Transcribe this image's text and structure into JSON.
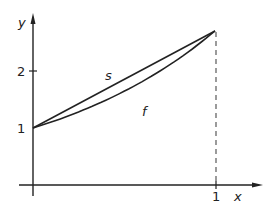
{
  "diagram": {
    "axes": {
      "x_label": "x",
      "y_label": "y",
      "x_ticks": [
        {
          "value": 1,
          "label": "1"
        }
      ],
      "y_ticks": [
        {
          "value": 1,
          "label": "1"
        },
        {
          "value": 2,
          "label": "2"
        }
      ]
    },
    "curves": [
      {
        "name": "f",
        "label": "f",
        "description": "convex curve from (0,1) to (1,e)",
        "function": "e^x"
      },
      {
        "name": "s",
        "label": "s",
        "description": "straight secant line from (0,1) to (1,e)"
      }
    ],
    "guide_line": {
      "style": "dashed",
      "x": 1,
      "from_y": 0,
      "to_y": 2.718
    },
    "colors": {
      "line": "#222222",
      "dashed": "#666666",
      "background": "#ffffff"
    }
  }
}
